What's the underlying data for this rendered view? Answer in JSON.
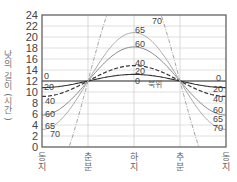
{
  "chart_data": {
    "type": "line",
    "title": "",
    "xlabel": "",
    "ylabel": "낮의 길이(시간)",
    "ylim": [
      0,
      24
    ],
    "yticks": [
      0,
      2,
      4,
      6,
      8,
      10,
      12,
      14,
      16,
      18,
      20,
      22,
      24
    ],
    "grid": true,
    "categories": [
      "동지",
      "춘분",
      "하지",
      "추분",
      "동지"
    ],
    "annotation": "북위",
    "series": [
      {
        "name": "0",
        "style": "solid-dark",
        "values": [
          12,
          12,
          12,
          12,
          12
        ]
      },
      {
        "name": "20",
        "style": "solid-dark",
        "values": [
          10.8,
          12,
          13.2,
          12,
          10.8
        ]
      },
      {
        "name": "40",
        "style": "dashed-dark",
        "values": [
          9.2,
          12,
          14.8,
          12,
          9.2
        ]
      },
      {
        "name": "60",
        "style": "solid-gray",
        "values": [
          5.8,
          12,
          18.2,
          12,
          5.8
        ]
      },
      {
        "name": "65",
        "style": "solid-light",
        "values": [
          3.5,
          12,
          20.8,
          12,
          3.5
        ]
      },
      {
        "name": "70",
        "style": "dashdot",
        "values": [
          0,
          12,
          24,
          12,
          0
        ]
      }
    ]
  },
  "labels": {
    "left": [
      "0",
      "20",
      "40",
      "60",
      "65",
      "70"
    ],
    "right": [
      "0",
      "20",
      "40",
      "60",
      "65",
      "70"
    ],
    "peak": [
      "70",
      "65",
      "60",
      "40",
      "20",
      "0"
    ]
  }
}
